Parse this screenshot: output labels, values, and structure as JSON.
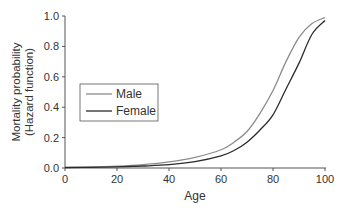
{
  "chart_data": {
    "type": "line",
    "title": "",
    "xlabel": "Age",
    "ylabel": [
      "Mortality probability",
      "(Hazard function)"
    ],
    "xlim": [
      0,
      100
    ],
    "ylim": [
      0,
      1.0
    ],
    "xticks": [
      "0",
      "20",
      "40",
      "60",
      "80",
      "100"
    ],
    "yticks": [
      "0.0",
      "0.2",
      "0.4",
      "0.6",
      "0.8",
      "1.0"
    ],
    "grid": false,
    "legend_position": "center-left",
    "x": [
      0,
      10,
      20,
      30,
      40,
      50,
      60,
      65,
      70,
      75,
      80,
      85,
      90,
      95,
      100
    ],
    "series": [
      {
        "name": "Male",
        "color": "#8c8c8c",
        "values": [
          0.005,
          0.007,
          0.012,
          0.022,
          0.04,
          0.07,
          0.12,
          0.17,
          0.24,
          0.36,
          0.51,
          0.7,
          0.86,
          0.95,
          0.99
        ]
      },
      {
        "name": "Female",
        "color": "#2b2b2b",
        "values": [
          0.003,
          0.004,
          0.007,
          0.013,
          0.022,
          0.042,
          0.08,
          0.115,
          0.17,
          0.25,
          0.35,
          0.52,
          0.69,
          0.88,
          0.97
        ]
      }
    ]
  }
}
